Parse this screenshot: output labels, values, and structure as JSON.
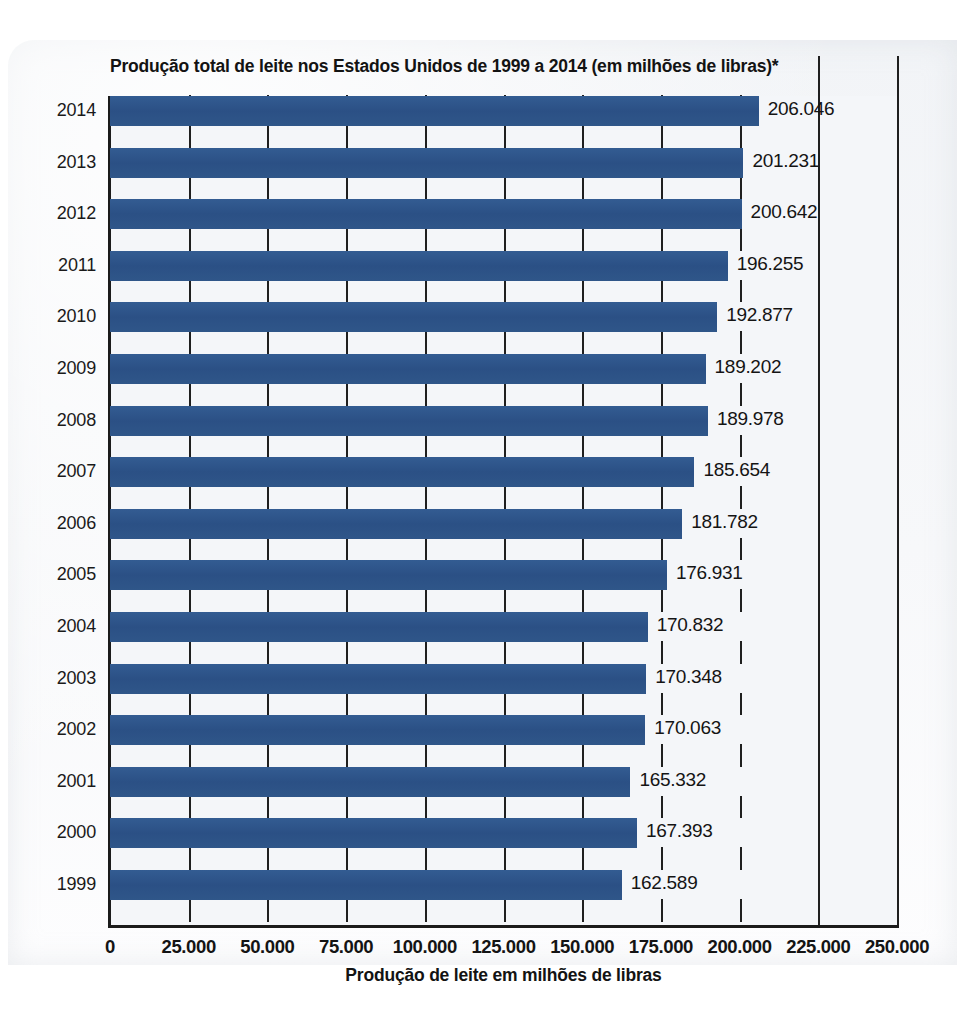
{
  "chart_data": {
    "type": "bar",
    "orientation": "horizontal",
    "title": "Produção total de leite nos Estados Unidos de 1999 a 2014 (em milhões de libras)*",
    "xlabel": "Produção de leite em milhões de libras",
    "ylabel": "",
    "xlim": [
      0,
      250000
    ],
    "xtick_labels": [
      "0",
      "25.000",
      "50.000",
      "75.000",
      "100.000",
      "125.000",
      "150.000",
      "175.000",
      "200.000",
      "225.000",
      "250.000"
    ],
    "xtick_values": [
      0,
      25000,
      50000,
      75000,
      100000,
      125000,
      150000,
      175000,
      200000,
      225000,
      250000
    ],
    "grid": true,
    "legend": null,
    "series_color": "#2d5488",
    "categories": [
      "2014",
      "2013",
      "2012",
      "2011",
      "2010",
      "2009",
      "2008",
      "2007",
      "2006",
      "2005",
      "2004",
      "2003",
      "2002",
      "2001",
      "2000",
      "1999"
    ],
    "values": [
      206046,
      201231,
      200642,
      196255,
      192877,
      189202,
      189978,
      185654,
      181782,
      176931,
      170832,
      170348,
      170063,
      165332,
      167393,
      162589
    ],
    "value_labels": [
      "206.046",
      "201.231",
      "200.642",
      "196.255",
      "192.877",
      "189.202",
      "189.978",
      "185.654",
      "181.782",
      "176.931",
      "170.832",
      "170.348",
      "170.063",
      "165.332",
      "167.393",
      "162.589"
    ],
    "bars": [
      {
        "category": "2014",
        "value": 206046,
        "label": "206.046"
      },
      {
        "category": "2013",
        "value": 201231,
        "label": "201.231"
      },
      {
        "category": "2012",
        "value": 200642,
        "label": "200.642"
      },
      {
        "category": "2011",
        "value": 196255,
        "label": "196.255"
      },
      {
        "category": "2010",
        "value": 192877,
        "label": "192.877"
      },
      {
        "category": "2009",
        "value": 189202,
        "label": "189.202"
      },
      {
        "category": "2008",
        "value": 189978,
        "label": "189.978"
      },
      {
        "category": "2007",
        "value": 185654,
        "label": "185.654"
      },
      {
        "category": "2006",
        "value": 181782,
        "label": "181.782"
      },
      {
        "category": "2005",
        "value": 176931,
        "label": "176.931"
      },
      {
        "category": "2004",
        "value": 170832,
        "label": "170.832"
      },
      {
        "category": "2003",
        "value": 170348,
        "label": "170.348"
      },
      {
        "category": "2002",
        "value": 170063,
        "label": "170.063"
      },
      {
        "category": "2001",
        "value": 165332,
        "label": "165.332"
      },
      {
        "category": "2000",
        "value": 167393,
        "label": "167.393"
      },
      {
        "category": "1999",
        "value": 162589,
        "label": "162.589"
      }
    ]
  }
}
